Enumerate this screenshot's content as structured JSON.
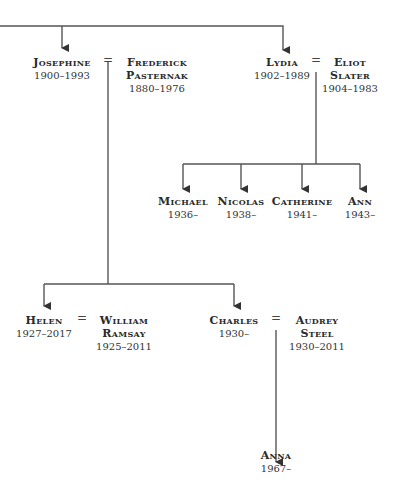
{
  "tree": {
    "generation1": {
      "josephine": {
        "name_lines": [
          "Josephine"
        ],
        "dates": "1900–1993"
      },
      "frederick": {
        "name_lines": [
          "Frederick",
          "Pasternak"
        ],
        "dates": "1880–1976"
      },
      "lydia": {
        "name_lines": [
          "Lydia"
        ],
        "dates": "1902–1989"
      },
      "eliot": {
        "name_lines": [
          "Eliot",
          "Slater"
        ],
        "dates": "1904–1983"
      }
    },
    "slater_children": [
      {
        "name": "Michael",
        "dates": "1936–"
      },
      {
        "name": "Nicolas",
        "dates": "1938–"
      },
      {
        "name": "Catherine",
        "dates": "1941–"
      },
      {
        "name": "Ann",
        "dates": "1943–"
      }
    ],
    "generation2": {
      "helen": {
        "name_lines": [
          "Helen"
        ],
        "dates": "1927–2017"
      },
      "william": {
        "name_lines": [
          "William",
          "Ramsay"
        ],
        "dates": "1925–2011"
      },
      "charles": {
        "name_lines": [
          "Charles"
        ],
        "dates": "1930–"
      },
      "audrey": {
        "name_lines": [
          "Audrey",
          "Steel"
        ],
        "dates": "1930–2011"
      }
    },
    "generation3": {
      "anna": {
        "name_lines": [
          "Anna"
        ],
        "dates": "1967–"
      }
    },
    "marriage_symbol": "="
  }
}
